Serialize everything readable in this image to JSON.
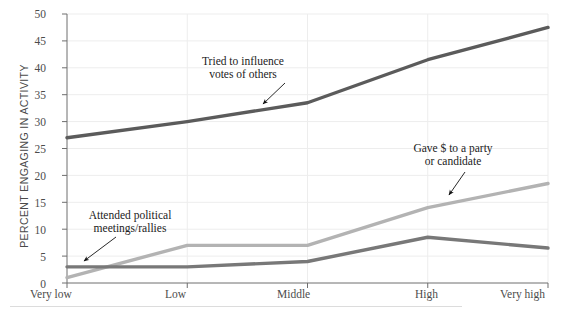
{
  "chart_data": {
    "type": "line",
    "title": "",
    "subtitle": "",
    "xlabel": "",
    "ylabel": "PERCENT ENGAGING IN ACTIVITY",
    "categories": [
      "Very low",
      "Low",
      "Middle",
      "High",
      "Very high"
    ],
    "ylim": [
      0,
      50
    ],
    "yticks": [
      0,
      5,
      10,
      15,
      20,
      25,
      30,
      35,
      40,
      45,
      50
    ],
    "grid": true,
    "legend_position": "annotations-inline",
    "series": [
      {
        "name": "Tried to influence votes of others",
        "color": "#5b5b5b",
        "values": [
          27,
          30,
          33.5,
          41.5,
          47.5
        ]
      },
      {
        "name": "Gave $ to a party or candidate",
        "color": "#b3b3b3",
        "values": [
          1,
          7,
          7,
          14,
          18.5
        ]
      },
      {
        "name": "Attended political meetings/rallies",
        "color": "#787878",
        "values": [
          3,
          3,
          4,
          8.5,
          6.5
        ]
      }
    ],
    "annotations": [
      {
        "id": "annotation-influence-votes",
        "lines": [
          "Tried to influence",
          "votes of others"
        ],
        "text_x": 243,
        "text_y": 55,
        "arrow_from_x": 285,
        "arrow_from_y": 83,
        "arrow_to_x": 263,
        "arrow_to_y": 104
      },
      {
        "id": "annotation-gave-money",
        "lines": [
          "Gave $ to a party",
          "or candidate"
        ],
        "text_x": 385,
        "text_y": 142,
        "arrow_from_x": 465,
        "arrow_from_y": 172,
        "arrow_to_x": 449,
        "arrow_to_y": 195
      },
      {
        "id": "annotation-attended-meetings",
        "lines": [
          "Attended political",
          "meetings/rallies"
        ],
        "text_x": 70,
        "text_y": 209,
        "arrow_from_x": 116,
        "arrow_from_y": 237,
        "arrow_to_x": 84,
        "arrow_to_y": 261
      }
    ]
  }
}
